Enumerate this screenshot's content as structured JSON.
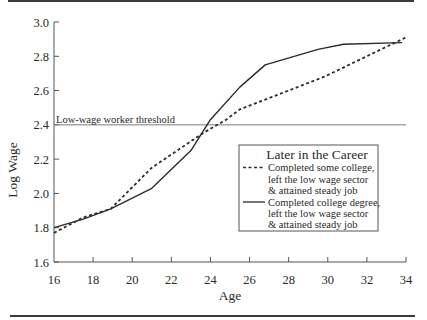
{
  "chart_data": {
    "type": "line",
    "title": "",
    "xlabel": "Age",
    "ylabel": "Log Wage",
    "xlim": [
      16,
      34
    ],
    "ylim": [
      1.6,
      3.0
    ],
    "x_ticks": [
      16,
      18,
      20,
      22,
      24,
      26,
      28,
      30,
      32,
      34
    ],
    "y_ticks": [
      1.6,
      1.8,
      2.0,
      2.2,
      2.4,
      2.6,
      2.8,
      3.0
    ],
    "x_tick_labels": [
      "16",
      "18",
      "20",
      "22",
      "24",
      "26",
      "28",
      "30",
      "32",
      "34"
    ],
    "y_tick_labels": [
      "1.6",
      "1.8",
      "2.0",
      "2.2",
      "2.4",
      "2.6",
      "2.8",
      "3.0"
    ],
    "grid": false,
    "reference_lines": [
      {
        "axis": "y",
        "value": 2.4,
        "label": "Low-wage worker threshold"
      }
    ],
    "legend": {
      "title": "Later in the Career",
      "position": "inside right-center"
    },
    "series": [
      {
        "name": "Completed some college, left the low wage sector & attained steady job",
        "legend_lines": [
          "Completed some college,",
          "left the low wage sector",
          "& attained steady job"
        ],
        "style": "dotted",
        "x": [
          16,
          17.5,
          18.9,
          21.0,
          23.6,
          24.8,
          25.5,
          29.8,
          34.0
        ],
        "y": [
          1.77,
          1.86,
          1.91,
          2.15,
          2.35,
          2.43,
          2.49,
          2.68,
          2.91
        ]
      },
      {
        "name": "Completed college degree, left the low wage sector & attained steady job",
        "legend_lines": [
          "Completed college degree,",
          "left the low wage sector",
          "& attained steady job"
        ],
        "style": "solid",
        "x": [
          16,
          17.5,
          18.9,
          21.0,
          23.0,
          24.0,
          25.5,
          26.8,
          29.5,
          30.8,
          33.8
        ],
        "y": [
          1.8,
          1.85,
          1.91,
          2.03,
          2.25,
          2.43,
          2.62,
          2.75,
          2.84,
          2.87,
          2.88
        ]
      }
    ]
  }
}
